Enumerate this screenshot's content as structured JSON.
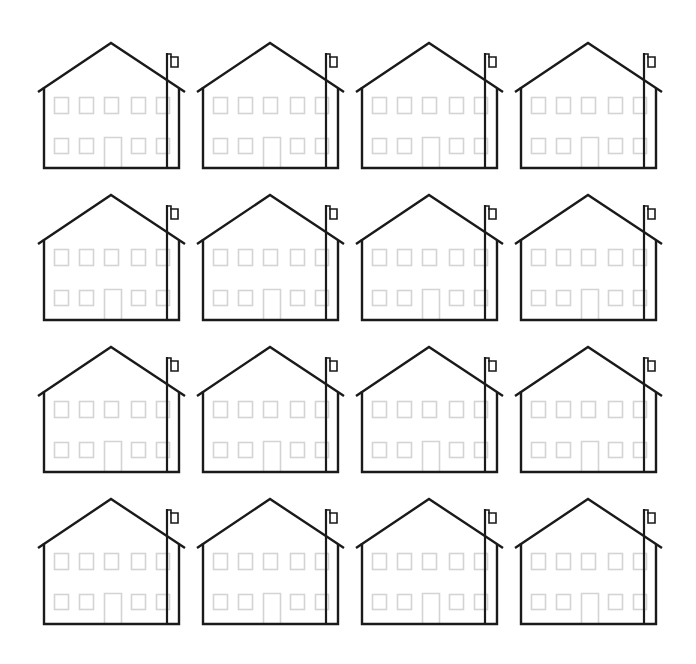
{
  "page": {
    "width": 696,
    "height": 664,
    "background": "#ffffff"
  },
  "grid": {
    "rows": 4,
    "columns": 4,
    "origin_x": 36,
    "origin_y": 40,
    "column_spacing": 159,
    "row_spacing": 152
  },
  "colors": {
    "outline": "#1a1a1a",
    "window": "#d4d4d4"
  },
  "house": {
    "description": "Gabled house outline with flagpole and flag, 10 light-gray windows (5 upper, 4 lower) and a central door",
    "icons": [
      "house-icon",
      "flagpole-icon",
      "flag-icon",
      "window-icon",
      "door-icon"
    ],
    "upper_windows": 5,
    "lower_windows": 4,
    "doors": 1,
    "flags": 1
  },
  "houses": [
    {
      "row": 0,
      "col": 0
    },
    {
      "row": 0,
      "col": 1
    },
    {
      "row": 0,
      "col": 2
    },
    {
      "row": 0,
      "col": 3
    },
    {
      "row": 1,
      "col": 0
    },
    {
      "row": 1,
      "col": 1
    },
    {
      "row": 1,
      "col": 2
    },
    {
      "row": 1,
      "col": 3
    },
    {
      "row": 2,
      "col": 0
    },
    {
      "row": 2,
      "col": 1
    },
    {
      "row": 2,
      "col": 2
    },
    {
      "row": 2,
      "col": 3
    },
    {
      "row": 3,
      "col": 0
    },
    {
      "row": 3,
      "col": 1
    },
    {
      "row": 3,
      "col": 2
    },
    {
      "row": 3,
      "col": 3
    }
  ]
}
